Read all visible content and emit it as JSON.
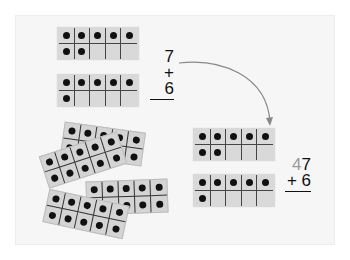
{
  "top_frames": [
    {
      "dots": [
        1,
        1,
        1,
        1,
        1,
        1,
        1,
        0,
        0,
        0
      ],
      "count": 7
    },
    {
      "dots": [
        1,
        1,
        1,
        1,
        1,
        1,
        0,
        0,
        0,
        0
      ],
      "count": 6
    }
  ],
  "sum_left": {
    "top": "7",
    "bottom": "+ 6"
  },
  "pile_frames": [
    {
      "dots": [
        1,
        1,
        1,
        1,
        1,
        1,
        1,
        1,
        1,
        1
      ]
    },
    {
      "dots": [
        1,
        1,
        1,
        1,
        1,
        1,
        1,
        1,
        1,
        1
      ]
    },
    {
      "dots": [
        1,
        1,
        1,
        1,
        1,
        1,
        1,
        1,
        1,
        1
      ]
    },
    {
      "dots": [
        1,
        1,
        1,
        1,
        1,
        1,
        1,
        1,
        1,
        1
      ]
    }
  ],
  "right_frames": [
    {
      "dots": [
        1,
        1,
        1,
        1,
        1,
        1,
        1,
        0,
        0,
        0
      ],
      "count": 7
    },
    {
      "dots": [
        1,
        1,
        1,
        1,
        1,
        1,
        0,
        0,
        0,
        0
      ],
      "count": 6
    }
  ],
  "sum_right": {
    "tens": "4",
    "ones": "7",
    "bottom": "+ 6"
  },
  "colors": {
    "panel": "#f6f6f6",
    "frame": "#d9d9d9",
    "arrow": "#888888",
    "tens_digit": "#9a9a9a"
  }
}
